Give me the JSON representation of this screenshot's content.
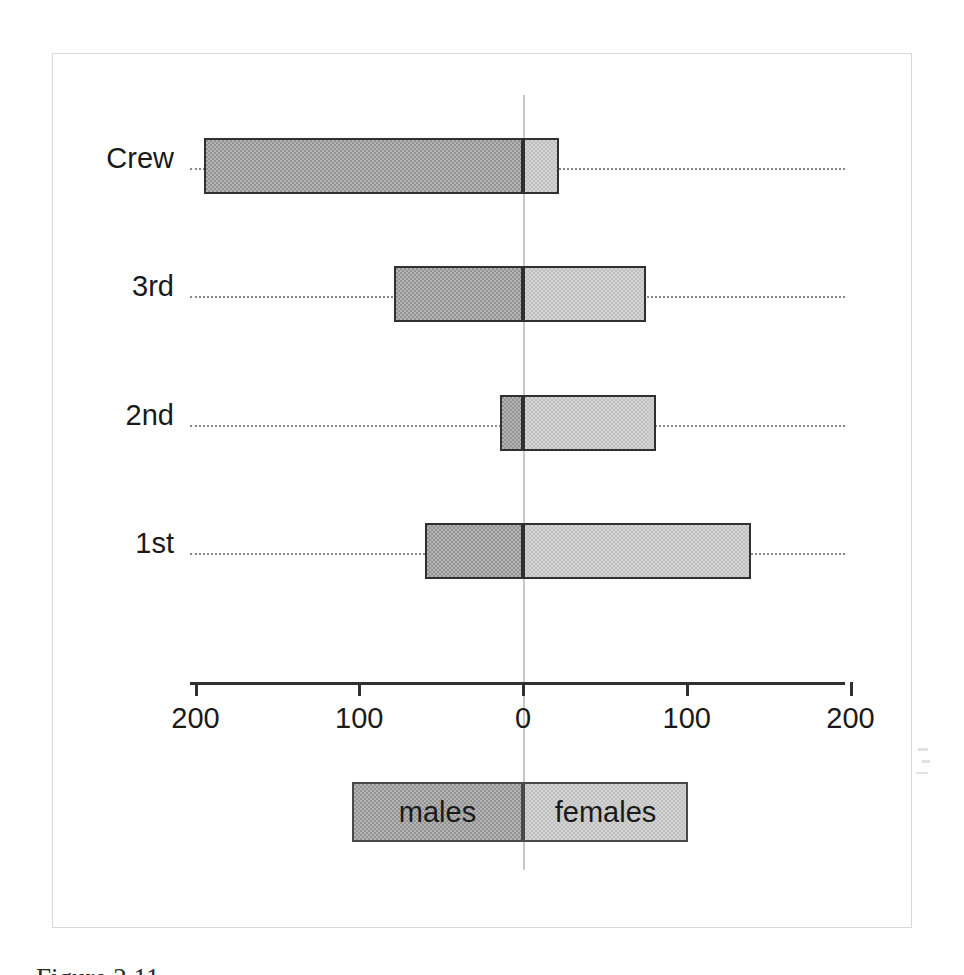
{
  "figure": {
    "caption_partial": "Figure 2.11",
    "background_color": "#ffffff",
    "frame_color": "#d8d8d8"
  },
  "colors": {
    "males_fill": "#939393",
    "females_fill": "#bfbfbf",
    "bar_border": "#303030",
    "axis": "#303030",
    "zero_line": "#c8c8c8",
    "guide_line": "#8a8a8a",
    "text": "#1a1a1a"
  },
  "legend": {
    "position": "below-axis",
    "entries": [
      {
        "label": "males",
        "color": "#939393"
      },
      {
        "label": "females",
        "color": "#bfbfbf"
      }
    ]
  },
  "axis": {
    "tick_labels": [
      "200",
      "100",
      "0",
      "100",
      "200"
    ],
    "tick_values": [
      -200,
      -100,
      0,
      100,
      200
    ],
    "left_label": "200",
    "center_label": "0",
    "right_label": "200"
  },
  "chart_data": {
    "type": "bar",
    "orientation": "horizontal",
    "style": "diverging-population-pyramid",
    "title": "",
    "subtitle": "",
    "xlabel": "",
    "ylabel": "",
    "categories": [
      "Crew",
      "3rd",
      "2nd",
      "1st"
    ],
    "category_order_top_to_bottom": [
      "Crew",
      "3rd",
      "2nd",
      "1st"
    ],
    "series": [
      {
        "name": "males",
        "direction": "left",
        "values": [
          195,
          79,
          14,
          60
        ]
      },
      {
        "name": "females",
        "direction": "right",
        "values": [
          22,
          75,
          81,
          139
        ]
      }
    ],
    "xlim": [
      -200,
      200
    ],
    "xticks": [
      -200,
      -100,
      0,
      100,
      200
    ],
    "xticklabels": [
      "200",
      "100",
      "0",
      "100",
      "200"
    ],
    "grid": false,
    "zero_reference_line": true,
    "dotted_category_guides": true,
    "legend_entries": [
      "males",
      "females"
    ],
    "legend_position": "bottom-center"
  },
  "rows": [
    {
      "label": "Crew",
      "males": 195,
      "females": 22,
      "guide_top": 168,
      "bar_top": 138,
      "label_top": 144
    },
    {
      "label": "3rd",
      "males": 79,
      "females": 75,
      "guide_top": 296,
      "bar_top": 266,
      "label_top": 272
    },
    {
      "label": "2nd",
      "males": 14,
      "females": 81,
      "guide_top": 425,
      "bar_top": 395,
      "label_top": 401
    },
    {
      "label": "1st",
      "males": 60,
      "females": 139,
      "guide_top": 553,
      "bar_top": 523,
      "label_top": 529
    }
  ],
  "geometry": {
    "x_zero_px": 523,
    "px_per_unit": 1.6375,
    "axis_left_px": 190,
    "axis_right_px": 845
  }
}
